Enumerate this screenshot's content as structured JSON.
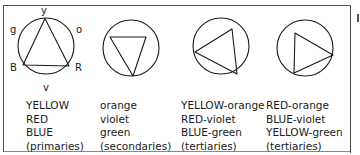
{
  "diagrams": [
    {
      "id": "primaries",
      "shape": "triangle-up",
      "points": {
        "top": "y",
        "upper_right": "o",
        "upper_left": "g",
        "lower_left": "B",
        "lower_right": "R",
        "bottom": "v"
      },
      "lines": [
        "YELLOW",
        "RED",
        "BLUE",
        "(primaries)"
      ]
    },
    {
      "id": "secondaries",
      "shape": "triangle-down",
      "lines": [
        "orange",
        "violet",
        "green",
        "(secondaries)"
      ]
    },
    {
      "id": "tertiaries-1",
      "shape": "triangle-left",
      "lines": [
        "YELLOW-orange",
        "RED-violet",
        "BLUE-green",
        "(tertiaries)"
      ]
    },
    {
      "id": "tertiaries-2",
      "shape": "triangle-right",
      "lines": [
        "RED-orange",
        "BLUE-violet",
        "YELLOW-green",
        "(tertiaries)"
      ]
    }
  ],
  "colors": {
    "stroke": "#1a1a1a",
    "frame": "#555555",
    "background": "#ffffff"
  }
}
